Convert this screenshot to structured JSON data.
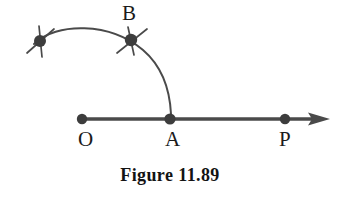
{
  "figure": {
    "caption": "Figure 11.89",
    "background_color": "#ffffff",
    "ink_color": "#4a4a4a",
    "label_color": "#1b1b1b",
    "labels": {
      "O": "O",
      "A": "A",
      "P": "P",
      "B": "B"
    },
    "elements": {
      "ray_name": "ray-OP",
      "arc_name": "arc-from-compass-point-through-B-to-A",
      "arrowhead_name": "ray-arrowhead",
      "point_O_name": "point-O",
      "point_A_name": "point-A",
      "point_P_name": "point-P",
      "point_B_name": "point-B",
      "compass_mark_left_name": "compass-tick-left",
      "compass_mark_B_name": "compass-tick-B"
    }
  },
  "geometry": {
    "ray": {
      "x1": 82,
      "y1": 119,
      "x2": 322,
      "y2": 119,
      "stroke_width": 3.4
    },
    "arrowhead": {
      "tip_x": 330,
      "tip_y": 119,
      "back_x": 310,
      "half_height": 7
    },
    "points": [
      {
        "id": "O",
        "x": 82,
        "y": 119,
        "r": 5.2
      },
      {
        "id": "A",
        "x": 170,
        "y": 119,
        "r": 5.6
      },
      {
        "id": "P",
        "x": 285,
        "y": 119,
        "r": 5.2
      },
      {
        "id": "B",
        "x": 131,
        "y": 40,
        "r": 6.2
      },
      {
        "id": "L",
        "x": 40,
        "y": 41,
        "r": 6.0
      }
    ],
    "arc": {
      "center_x": 86,
      "center_y": 126,
      "radius": 88,
      "start_x": 34,
      "start_y": 44,
      "end_x": 171,
      "end_y": 114,
      "stroke_width": 2.0,
      "path": "M 34 44 C 56 22 110 22 143 50 C 164 68 170 94 171 114"
    },
    "ticks": [
      {
        "id": "tick-left-major",
        "x1": 27,
        "y1": 53,
        "x2": 54,
        "y2": 29
      },
      {
        "id": "tick-left-minor",
        "x1": 39,
        "y1": 27,
        "x2": 42,
        "y2": 56
      },
      {
        "id": "tick-B-major",
        "x1": 118,
        "y1": 52,
        "x2": 146,
        "y2": 30
      },
      {
        "id": "tick-B-minor",
        "x1": 129,
        "y1": 28,
        "x2": 134,
        "y2": 54
      }
    ]
  }
}
